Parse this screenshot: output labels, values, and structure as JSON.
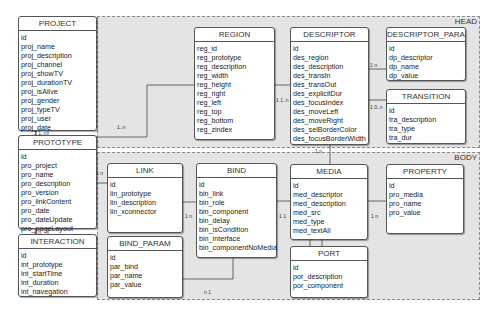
{
  "groups": {
    "head": {
      "label": "HEAD"
    },
    "body": {
      "label": "BODY"
    }
  },
  "entities": {
    "project": {
      "title": "PROJECT",
      "fields": [
        "id",
        "proj_name",
        "proj_description",
        "proj_channel",
        "proj_showTV",
        "proj_durationTV",
        "proj_isAlive",
        "proj_gender",
        "proj_typeTV",
        "proj_user",
        "proj_date"
      ]
    },
    "prototype": {
      "title": "PROTOTYPE",
      "fields": [
        "id",
        "pro_project",
        "pro_name",
        "pro_description",
        "pro_version",
        "pro_linkContent",
        "pro_date",
        "pro_dateUpdate",
        "pro_pageLayout"
      ]
    },
    "interaction": {
      "title": "INTERACTION",
      "fields": [
        "id",
        "int_prototype",
        "int_startTime",
        "int_duration",
        "int_navegation"
      ]
    },
    "region": {
      "title": "REGION",
      "fields": [
        "reg_id",
        "reg_prototype",
        "reg_description",
        "reg_width",
        "reg_height",
        "reg_right",
        "reg_left",
        "reg_top",
        "reg_bottom",
        "reg_zindex"
      ]
    },
    "descriptor": {
      "title": "DESCRIPTOR",
      "fields": [
        "id",
        "des_region",
        "des_description",
        "des_transIn",
        "des_transOut",
        "des_explicitDur",
        "des_focusIndex",
        "des_moveLeft",
        "des_moveRight",
        "des_selBorderColor",
        "des_focusBorderWidth"
      ]
    },
    "descriptor_param": {
      "title": "DESCRIPTOR_PARAM",
      "fields": [
        "id",
        "dp_descriptor",
        "dp_name",
        "dp_value"
      ]
    },
    "transition": {
      "title": "TRANSITION",
      "fields": [
        "id",
        "tra_description",
        "tra_type",
        "tra_dur"
      ]
    },
    "link": {
      "title": "LINK",
      "fields": [
        "id",
        "lin_prototype",
        "lin_description",
        "lin_xconnector"
      ]
    },
    "bind": {
      "title": "BIND",
      "fields": [
        "id",
        "bin_link",
        "bin_role",
        "bin_component",
        "bin_delay",
        "bin_isCondition",
        "bin_interface",
        "bin_componentNoMedia"
      ]
    },
    "bind_param": {
      "title": "BIND_PARAM",
      "fields": [
        "id",
        "par_bind",
        "par_name",
        "par_value"
      ]
    },
    "media": {
      "title": "MEDIA",
      "fields": [
        "id",
        "med_descriptor",
        "med_description",
        "med_src",
        "med_type",
        "med_textAll"
      ]
    },
    "property": {
      "title": "PROPERTY",
      "fields": [
        "id",
        "pro_media",
        "pro_name",
        "pro_value"
      ]
    },
    "port": {
      "title": "PORT",
      "fields": [
        "id",
        "por_description",
        "por_component"
      ]
    }
  },
  "cardinalities": {
    "project_prototype": "1   1..n",
    "prototype_region": "1..n",
    "region_descriptor": "1   1..n",
    "descriptor_param": "1      n",
    "descriptor_transition": "1   0..n",
    "descriptor_media": "1   n",
    "prototype_link": "1   n",
    "link_bind": "1   n",
    "bind_media": "1   1",
    "media_property": "1   n",
    "bind_param": "n 1",
    "prototype_interaction": "1   n"
  }
}
